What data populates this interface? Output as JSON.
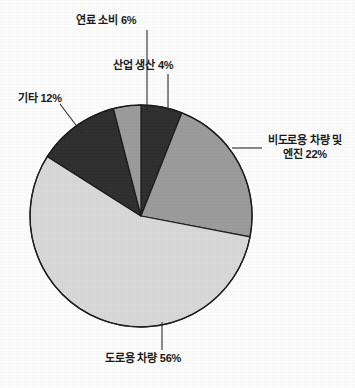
{
  "chart_data": {
    "type": "pie",
    "title": "",
    "subtitle": "",
    "xlabel": "",
    "ylabel": "",
    "legend_position": "none",
    "grid": false,
    "labels_outside": true,
    "categories": [
      "도로용 차량",
      "비도로용 차량 및 엔진",
      "기타",
      "연료 소비",
      "산업 생산"
    ],
    "values": [
      56,
      22,
      12,
      6,
      4
    ],
    "unit": "%",
    "slices": [
      {
        "id": "road-vehicles",
        "name": "도로용 차량",
        "value": 56,
        "value_text": "56%",
        "label_text": "도로용 차량 56%",
        "color": "#d9d9d9",
        "leader": "down"
      },
      {
        "id": "nonroad-vehicles",
        "name": "비도로용 차량 및 엔진",
        "value": 22,
        "value_text": "22%",
        "label_line1": "비도로용 차량 및",
        "label_line2": "엔진 22%",
        "color": "#9b9b9b",
        "leader": "right"
      },
      {
        "id": "other",
        "name": "기타",
        "value": 12,
        "value_text": "12%",
        "label_text": "기타 12%",
        "color": "#2e2e2e",
        "leader": "diagonal-up-left"
      },
      {
        "id": "fuel-consumption",
        "name": "연료 소비",
        "value": 6,
        "value_text": "6%",
        "label_text": "연료 소비 6%",
        "color": "#2e2e2e",
        "leader": "up"
      },
      {
        "id": "industrial-production",
        "name": "산업 생산",
        "value": 4,
        "value_text": "4%",
        "label_text": "산업 생산 4%",
        "color": "#9b9b9b",
        "leader": "up"
      }
    ],
    "colors": {
      "background": "#fdfdfd",
      "outline": "#1a1a1a",
      "text": "#181818",
      "light_gray": "#d9d9d9",
      "medium_gray": "#9b9b9b",
      "dark_gray": "#2e2e2e"
    }
  }
}
